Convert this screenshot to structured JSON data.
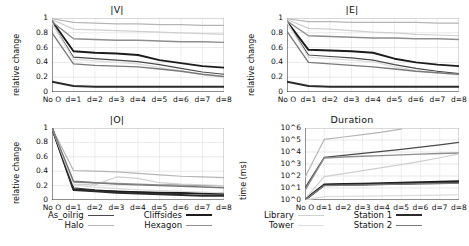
{
  "figure": {
    "width": 469,
    "height": 246,
    "background": "#ffffff"
  },
  "series_styles": [
    {
      "name": "As_oilrig",
      "color": "#4a4a4a",
      "width": 1.2
    },
    {
      "name": "Cliffsides",
      "color": "#1c1c1c",
      "width": 1.9
    },
    {
      "name": "Halo",
      "color": "#b5b5b5",
      "width": 1.2
    },
    {
      "name": "Hexagon",
      "color": "#8e8e8e",
      "width": 1.4
    },
    {
      "name": "Library",
      "color": "#cfcfcf",
      "width": 1.2
    },
    {
      "name": "Station 1",
      "color": "#2b2b2b",
      "width": 2.0
    },
    {
      "name": "Tower",
      "color": "#dcdcdc",
      "width": 1.3
    },
    {
      "name": "Station 2",
      "color": "#7a7a7a",
      "width": 1.4
    }
  ],
  "legend_left": {
    "rows": [
      {
        "left_label": "As_oilrig",
        "right_label": "Cliffsides"
      },
      {
        "left_label": "Halo",
        "right_label": "Hexagon"
      }
    ]
  },
  "legend_right": {
    "rows": [
      {
        "left_label": "Library",
        "right_label": "Station 1"
      },
      {
        "left_label": "Tower",
        "right_label": "Station 2"
      }
    ]
  },
  "chart_data": [
    {
      "type": "line",
      "title": "|V|",
      "xlabel": "",
      "ylabel": "relative change",
      "x": [
        "No O",
        "d=1",
        "d=2",
        "d=3",
        "d=4",
        "d=5",
        "d=6",
        "d=7",
        "d=8"
      ],
      "xtick_labels": [
        "No O",
        "d=1",
        "d=2",
        "d=3",
        "d=4",
        "d=5",
        "d=6",
        "d=7",
        "d=8"
      ],
      "ytick_labels": [
        "0",
        "0.2",
        "0.4",
        "0.6",
        "0.8",
        "1"
      ],
      "yticks": [
        0,
        0.2,
        0.4,
        0.6,
        0.8,
        1
      ],
      "ylim": [
        0,
        1
      ],
      "grid": true,
      "legend_position": "below-figure",
      "series": [
        {
          "name": "As_oilrig",
          "values": [
            0.93,
            0.47,
            0.45,
            0.43,
            0.41,
            0.37,
            0.32,
            0.27,
            0.24
          ]
        },
        {
          "name": "Cliffsides",
          "values": [
            0.96,
            0.55,
            0.53,
            0.52,
            0.5,
            0.43,
            0.39,
            0.35,
            0.33
          ]
        },
        {
          "name": "Halo",
          "values": [
            0.99,
            0.94,
            0.93,
            0.92,
            0.92,
            0.91,
            0.91,
            0.9,
            0.9
          ]
        },
        {
          "name": "Hexagon",
          "values": [
            0.95,
            0.72,
            0.71,
            0.7,
            0.7,
            0.69,
            0.68,
            0.68,
            0.67
          ]
        },
        {
          "name": "Library",
          "values": [
            0.98,
            0.85,
            0.84,
            0.83,
            0.82,
            0.81,
            0.8,
            0.79,
            0.78
          ]
        },
        {
          "name": "Station 1",
          "values": [
            0.14,
            0.08,
            0.07,
            0.07,
            0.07,
            0.07,
            0.07,
            0.07,
            0.07
          ]
        },
        {
          "name": "Tower",
          "values": [
            0.93,
            0.44,
            0.42,
            0.4,
            0.38,
            0.33,
            0.29,
            0.23,
            0.2
          ]
        },
        {
          "name": "Station 2",
          "values": [
            0.8,
            0.38,
            0.36,
            0.35,
            0.34,
            0.31,
            0.28,
            0.24,
            0.21
          ]
        }
      ]
    },
    {
      "type": "line",
      "title": "|E|",
      "xlabel": "",
      "ylabel": "relative change",
      "x": [
        "No O",
        "d=1",
        "d=2",
        "d=3",
        "d=4",
        "d=5",
        "d=6",
        "d=7",
        "d=8"
      ],
      "xtick_labels": [
        "No O",
        "d=1",
        "d=2",
        "d=3",
        "d=4",
        "d=5",
        "d=6",
        "d=7",
        "d=8"
      ],
      "ytick_labels": [
        "0",
        "0.2",
        "0.4",
        "0.6",
        "0.8",
        "1"
      ],
      "yticks": [
        0,
        0.2,
        0.4,
        0.6,
        0.8,
        1
      ],
      "ylim": [
        0,
        1
      ],
      "grid": true,
      "legend_position": "below-figure",
      "series": [
        {
          "name": "As_oilrig",
          "values": [
            0.94,
            0.5,
            0.48,
            0.46,
            0.43,
            0.37,
            0.32,
            0.28,
            0.25
          ]
        },
        {
          "name": "Cliffsides",
          "values": [
            0.95,
            0.57,
            0.56,
            0.55,
            0.53,
            0.45,
            0.4,
            0.37,
            0.35
          ]
        },
        {
          "name": "Halo",
          "values": [
            0.99,
            0.95,
            0.95,
            0.94,
            0.94,
            0.94,
            0.94,
            0.93,
            0.93
          ]
        },
        {
          "name": "Hexagon",
          "values": [
            0.96,
            0.76,
            0.75,
            0.74,
            0.73,
            0.73,
            0.72,
            0.72,
            0.71
          ]
        },
        {
          "name": "Library",
          "values": [
            0.98,
            0.86,
            0.85,
            0.83,
            0.81,
            0.8,
            0.78,
            0.77,
            0.76
          ]
        },
        {
          "name": "Station 1",
          "values": [
            0.14,
            0.08,
            0.07,
            0.07,
            0.07,
            0.07,
            0.07,
            0.07,
            0.07
          ]
        },
        {
          "name": "Tower",
          "values": [
            0.94,
            0.47,
            0.45,
            0.43,
            0.41,
            0.34,
            0.29,
            0.26,
            0.23
          ]
        },
        {
          "name": "Station 2",
          "values": [
            0.82,
            0.4,
            0.38,
            0.36,
            0.34,
            0.31,
            0.28,
            0.26,
            0.24
          ]
        }
      ]
    },
    {
      "type": "line",
      "title": "|O|",
      "xlabel": "",
      "ylabel": "relative change",
      "x": [
        "No O",
        "d=1",
        "d=2",
        "d=3",
        "d=4",
        "d=5",
        "d=6",
        "d=7",
        "d=8"
      ],
      "xtick_labels": [
        "No O",
        "d=1",
        "d=2",
        "d=3",
        "d=4",
        "d=5",
        "d=6",
        "d=7",
        "d=8"
      ],
      "ytick_labels": [
        "0",
        "0.2",
        "0.4",
        "0.6",
        "0.8",
        "1"
      ],
      "yticks": [
        0,
        0.2,
        0.4,
        0.6,
        0.8,
        1
      ],
      "ylim": [
        0,
        1
      ],
      "grid": true,
      "legend_position": "below-figure",
      "series": [
        {
          "name": "As_oilrig",
          "values": [
            1.0,
            0.17,
            0.14,
            0.12,
            0.11,
            0.1,
            0.09,
            0.09,
            0.08
          ]
        },
        {
          "name": "Cliffsides",
          "values": [
            1.0,
            0.15,
            0.13,
            0.12,
            0.11,
            0.1,
            0.1,
            0.09,
            0.09
          ]
        },
        {
          "name": "Halo",
          "values": [
            1.0,
            0.41,
            0.4,
            0.39,
            0.37,
            0.35,
            0.33,
            0.32,
            0.31
          ]
        },
        {
          "name": "Hexagon",
          "values": [
            1.0,
            0.25,
            0.24,
            0.23,
            0.22,
            0.21,
            0.21,
            0.2,
            0.2
          ]
        },
        {
          "name": "Library",
          "values": [
            1.0,
            0.22,
            0.21,
            0.32,
            0.3,
            0.24,
            0.22,
            0.21,
            0.2
          ]
        },
        {
          "name": "Station 1",
          "values": [
            1.0,
            0.14,
            0.12,
            0.1,
            0.09,
            0.08,
            0.07,
            0.06,
            0.06
          ]
        },
        {
          "name": "Tower",
          "values": [
            1.0,
            0.21,
            0.18,
            0.16,
            0.14,
            0.13,
            0.12,
            0.11,
            0.1
          ]
        },
        {
          "name": "Station 2",
          "values": [
            1.0,
            0.26,
            0.24,
            0.22,
            0.21,
            0.2,
            0.19,
            0.18,
            0.17
          ]
        }
      ]
    },
    {
      "type": "line",
      "title": "Duration",
      "xlabel": "",
      "ylabel": "time (ms)",
      "yscale": "log",
      "x": [
        "No O",
        "d=1",
        "d=2",
        "d=3",
        "d=4",
        "d=5",
        "d=6",
        "d=7",
        "d=8"
      ],
      "xtick_labels": [
        "No O",
        "d=1",
        "d=2",
        "d=3",
        "d=4",
        "d=5",
        "d=6",
        "d=7",
        "d=8"
      ],
      "ytick_labels": [
        "10^0",
        "10^1",
        "10^2",
        "10^3",
        "10^4",
        "10^5",
        "10^6"
      ],
      "yticks": [
        0,
        1,
        2,
        3,
        4,
        5,
        6
      ],
      "ylim": [
        0,
        6
      ],
      "grid": true,
      "legend_position": "below-figure",
      "series": [
        {
          "name": "As_oilrig",
          "values": [
            1.0,
            3.55,
            3.72,
            3.88,
            4.05,
            4.22,
            4.4,
            4.6,
            4.8
          ]
        },
        {
          "name": "Cliffsides",
          "values": [
            0.05,
            1.3,
            1.33,
            1.36,
            1.4,
            1.44,
            1.48,
            1.52,
            1.56
          ]
        },
        {
          "name": "Halo",
          "values": [
            1.9,
            5.05,
            5.25,
            5.45,
            5.65,
            5.9,
            null,
            null,
            null
          ]
        },
        {
          "name": "Hexagon",
          "values": [
            0.8,
            3.5,
            3.58,
            3.64,
            3.7,
            3.76,
            3.82,
            3.88,
            3.92
          ]
        },
        {
          "name": "Library",
          "values": [
            0.05,
            1.95,
            2.2,
            2.45,
            2.7,
            2.95,
            3.22,
            3.52,
            3.85
          ]
        },
        {
          "name": "Station 1",
          "values": [
            0.0,
            1.25,
            1.28,
            1.3,
            1.33,
            1.36,
            1.39,
            1.42,
            1.45
          ]
        },
        {
          "name": "Tower",
          "values": [
            0.0,
            0.28,
            0.3,
            0.32,
            0.34,
            0.36,
            0.38,
            0.4,
            0.42
          ]
        },
        {
          "name": "Station 2",
          "values": [
            0.02,
            1.2,
            1.23,
            1.26,
            1.29,
            1.32,
            1.35,
            1.38,
            1.41
          ]
        }
      ]
    }
  ]
}
